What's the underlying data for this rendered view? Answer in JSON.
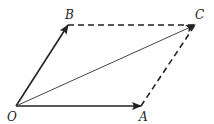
{
  "diagram": {
    "points": {
      "O": {
        "label": "O",
        "x": 16,
        "y": 106
      },
      "A": {
        "label": "A",
        "x": 141,
        "y": 106
      },
      "B": {
        "label": "B",
        "x": 68,
        "y": 25
      },
      "C": {
        "label": "C",
        "x": 195,
        "y": 25
      }
    },
    "vectors": [
      {
        "from": "O",
        "to": "A",
        "style": "solid-arrow"
      },
      {
        "from": "O",
        "to": "B",
        "style": "solid-arrow"
      },
      {
        "from": "O",
        "to": "C",
        "style": "solid-arrow-thin"
      }
    ],
    "dashed_edges": [
      {
        "from": "B",
        "to": "C"
      },
      {
        "from": "A",
        "to": "C"
      }
    ],
    "colors": {
      "stroke": "#222222",
      "background": "#ffffff"
    }
  }
}
